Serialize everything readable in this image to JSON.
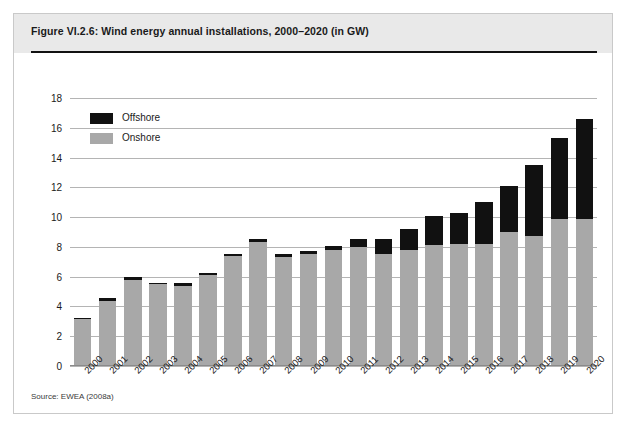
{
  "figure": {
    "title": "Figure VI.2.6: Wind energy annual installations, 2000–2020 (in GW)",
    "source": "Source: EWEA (2008a)"
  },
  "legend": {
    "position": "inside-top-left",
    "items": [
      {
        "label": "Offshore",
        "color": "#111111",
        "name": "legend-offshore"
      },
      {
        "label": "Onshore",
        "color": "#a8a8a8",
        "name": "legend-onshore"
      }
    ]
  },
  "colors": {
    "offshore": "#111111",
    "onshore": "#a8a8a8",
    "gridline": "#b4b4b4",
    "header_band": "#e9e9e9",
    "frame_border": "#c9c9c9",
    "title_rule": "#111111"
  },
  "chart_data": {
    "type": "bar",
    "stacked": true,
    "title": "Wind energy annual installations, 2000–2020 (in GW)",
    "xlabel": "",
    "ylabel": "",
    "ylim": [
      0,
      18
    ],
    "yticks": [
      0,
      2,
      4,
      6,
      8,
      10,
      12,
      14,
      16,
      18
    ],
    "ytick_labels": [
      "0",
      "2",
      "4",
      "6",
      "8",
      "10",
      "12",
      "14",
      "16",
      "18"
    ],
    "grid": true,
    "legend_position": "inside-top-left",
    "categories": [
      "2000",
      "2001",
      "2002",
      "2003",
      "2004",
      "2005",
      "2006",
      "2007",
      "2008",
      "2009",
      "2010",
      "2011",
      "2012",
      "2013",
      "2014",
      "2015",
      "2016",
      "2017",
      "2018",
      "2019",
      "2020"
    ],
    "series": [
      {
        "name": "Onshore",
        "color": "#a8a8a8",
        "values": [
          3.15,
          4.4,
          5.8,
          5.5,
          5.4,
          6.1,
          7.4,
          8.3,
          7.3,
          7.5,
          7.8,
          8.0,
          7.5,
          7.8,
          8.1,
          8.2,
          8.2,
          9.0,
          8.7,
          9.9,
          9.9
        ]
      },
      {
        "name": "Offshore",
        "color": "#111111",
        "values": [
          0.05,
          0.15,
          0.15,
          0.1,
          0.15,
          0.15,
          0.15,
          0.2,
          0.25,
          0.2,
          0.25,
          0.5,
          1.0,
          1.4,
          2.0,
          2.1,
          2.8,
          3.1,
          4.8,
          5.4,
          6.7
        ]
      }
    ],
    "totals": [
      3.2,
      4.55,
      5.95,
      5.6,
      5.55,
      6.25,
      7.55,
      8.5,
      7.55,
      7.7,
      8.05,
      8.5,
      8.5,
      9.2,
      10.1,
      10.3,
      11.0,
      12.1,
      13.5,
      15.3,
      16.6
    ]
  }
}
